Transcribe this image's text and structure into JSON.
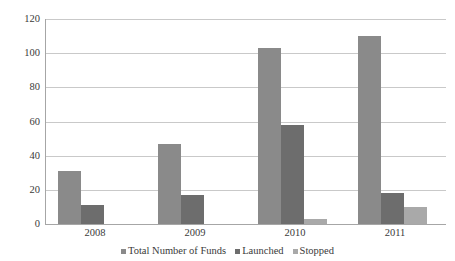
{
  "chart_data": {
    "type": "bar",
    "title": "",
    "subtitle": "",
    "xlabel": "",
    "ylabel": "",
    "categories": [
      "2008",
      "2009",
      "2010",
      "2011"
    ],
    "series": [
      {
        "name": "Total Number of Funds",
        "color": "#8a8a8a",
        "values": [
          31,
          47,
          103,
          110
        ]
      },
      {
        "name": "Launched",
        "color": "#6d6d6d",
        "values": [
          11,
          17,
          58,
          18
        ]
      },
      {
        "name": "Stopped",
        "color": "#a9a9a9",
        "values": [
          0,
          0,
          3,
          10
        ]
      }
    ],
    "ylim": [
      0,
      120
    ],
    "y_ticks": [
      0,
      20,
      40,
      60,
      80,
      100,
      120
    ],
    "y_tick_labels": [
      "0",
      "20",
      "40",
      "60",
      "80",
      "100",
      "120"
    ],
    "grid": "horizontal",
    "legend_position": "bottom"
  },
  "legend": {
    "items": [
      {
        "label": "Total Number of Funds"
      },
      {
        "label": "Launched"
      },
      {
        "label": "Stopped"
      }
    ]
  }
}
